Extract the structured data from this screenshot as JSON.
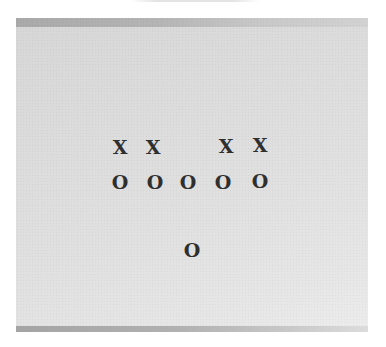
{
  "diagram": {
    "type": "play-diagram",
    "background_color": "#dcdcdc",
    "mark_color": "#2f2f2f",
    "offense_symbol": "O",
    "defense_symbol": "X",
    "defense_row": [
      {
        "label": "X",
        "x": 120,
        "y": 147
      },
      {
        "label": "X",
        "x": 153,
        "y": 147
      },
      {
        "label": "X",
        "x": 226,
        "y": 146
      },
      {
        "label": "X",
        "x": 260,
        "y": 145
      }
    ],
    "offense_line": [
      {
        "label": "O",
        "x": 120,
        "y": 182
      },
      {
        "label": "O",
        "x": 155,
        "y": 182
      },
      {
        "label": "O",
        "x": 188,
        "y": 182
      },
      {
        "label": "O",
        "x": 223,
        "y": 182
      },
      {
        "label": "O",
        "x": 260,
        "y": 181
      }
    ],
    "backfield": [
      {
        "label": "O",
        "x": 192,
        "y": 250
      }
    ]
  }
}
